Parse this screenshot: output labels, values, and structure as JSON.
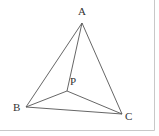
{
  "figure": {
    "points": {
      "A": {
        "label": "A"
      },
      "B": {
        "label": "B"
      },
      "C": {
        "label": "C"
      },
      "P": {
        "label": "P"
      }
    },
    "segments": [
      [
        "A",
        "B"
      ],
      [
        "B",
        "C"
      ],
      [
        "C",
        "A"
      ],
      [
        "P",
        "A"
      ],
      [
        "P",
        "B"
      ],
      [
        "P",
        "C"
      ]
    ],
    "colors": {
      "line": "#555555",
      "text": "#333333",
      "frame": "#c8c8c8"
    }
  }
}
